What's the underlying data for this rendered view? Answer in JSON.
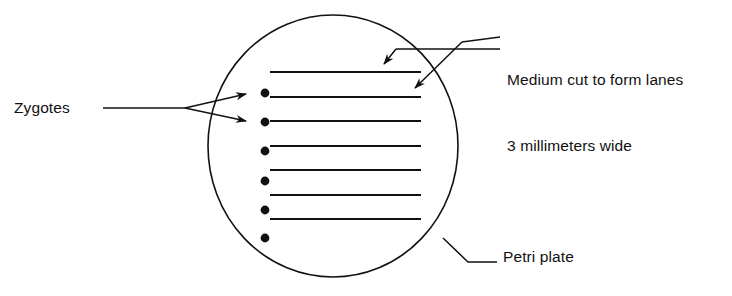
{
  "figure": {
    "background_color": "#ffffff",
    "ink_color": "#111111",
    "width": 732,
    "height": 296
  },
  "labels": {
    "zygotes": "Zygotes",
    "medium_line1": "Medium cut to form lanes",
    "medium_line2": "3 millimeters wide",
    "petri_plate": "Petri plate"
  },
  "plate": {
    "name": "petri-plate",
    "shape": "ellipse",
    "center_x": 333,
    "center_y": 146,
    "radius_x": 125,
    "radius_y": 131,
    "stroke_width": 1.6
  },
  "lanes": {
    "count": 7,
    "x_start": 270,
    "x_end": 421,
    "stroke_width": 2.2,
    "y_positions": [
      72,
      97,
      121,
      146,
      170,
      195,
      219
    ],
    "width_label": "3 millimeters wide"
  },
  "zygotes": {
    "count": 6,
    "x": 265,
    "radius": 4.2,
    "y_positions": [
      93,
      122,
      151,
      181,
      210,
      238
    ]
  },
  "leaders": {
    "zygotes": {
      "stem_start_x": 103,
      "stem_end_x": 183,
      "y": 108,
      "arrow1_tip_x": 256,
      "arrow1_tip_y": 93,
      "arrow2_tip_x": 256,
      "arrow2_tip_y": 122
    },
    "medium": {
      "stem_start_x": 500,
      "stem_end_x": 395,
      "y": 49,
      "arrow_tip_x": 388,
      "arrow_tip_y": 70
    },
    "medium2": {
      "stem_start_x": 500,
      "stem_end_x": 462,
      "y": 43,
      "arrow_tip_x": 417,
      "arrow_tip_y": 95
    },
    "petri": {
      "touch_x": 443,
      "touch_y": 238,
      "bend_x": 467,
      "bend_y": 261,
      "stem_end_x": 497,
      "stem_end_y": 261
    }
  }
}
